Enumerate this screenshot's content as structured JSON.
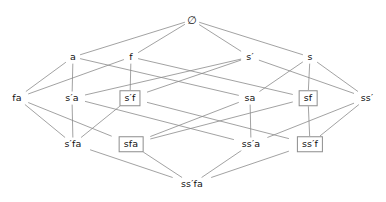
{
  "diagram": {
    "type": "hasse-lattice",
    "title": "",
    "width": 386,
    "height": 202,
    "edge_color": "#8a8a8a",
    "node_text_color": "#111111",
    "box_border_color": "#8d8d8d",
    "background": "#ffffff",
    "nodes": [
      {
        "id": "empty",
        "label": "∅",
        "x": 192,
        "y": 20,
        "boxed": false,
        "rank": 0
      },
      {
        "id": "a",
        "label": "a",
        "x": 73,
        "y": 57,
        "boxed": false,
        "rank": 1
      },
      {
        "id": "f",
        "label": "f",
        "x": 131,
        "y": 57,
        "boxed": false,
        "rank": 1
      },
      {
        "id": "s1",
        "label": "s′",
        "x": 250,
        "y": 57,
        "boxed": false,
        "rank": 1
      },
      {
        "id": "s",
        "label": "s",
        "x": 310,
        "y": 57,
        "boxed": false,
        "rank": 1
      },
      {
        "id": "fa",
        "label": "fa",
        "x": 17,
        "y": 98,
        "boxed": false,
        "rank": 2
      },
      {
        "id": "s1a",
        "label": "s′a",
        "x": 72,
        "y": 98,
        "boxed": false,
        "rank": 2
      },
      {
        "id": "s1f",
        "label": "s′f",
        "x": 130,
        "y": 98,
        "boxed": true,
        "rank": 2
      },
      {
        "id": "sa",
        "label": "sa",
        "x": 250,
        "y": 98,
        "boxed": false,
        "rank": 2
      },
      {
        "id": "sf",
        "label": "sf",
        "x": 308,
        "y": 98,
        "boxed": true,
        "rank": 2
      },
      {
        "id": "ss1",
        "label": "ss′",
        "x": 367,
        "y": 98,
        "boxed": false,
        "rank": 2
      },
      {
        "id": "s1fa",
        "label": "s′fa",
        "x": 73,
        "y": 144,
        "boxed": false,
        "rank": 3
      },
      {
        "id": "sfa",
        "label": "sfa",
        "x": 131,
        "y": 144,
        "boxed": true,
        "rank": 3
      },
      {
        "id": "ss1a",
        "label": "ss′a",
        "x": 251,
        "y": 144,
        "boxed": false,
        "rank": 3
      },
      {
        "id": "ss1f",
        "label": "ss′f",
        "x": 310,
        "y": 144,
        "boxed": true,
        "rank": 3
      },
      {
        "id": "ss1fa",
        "label": "ss′fa",
        "x": 192,
        "y": 184,
        "boxed": false,
        "rank": 4
      }
    ],
    "edges": [
      {
        "from": "empty",
        "to": "a"
      },
      {
        "from": "empty",
        "to": "f"
      },
      {
        "from": "empty",
        "to": "s1"
      },
      {
        "from": "empty",
        "to": "s"
      },
      {
        "from": "a",
        "to": "fa"
      },
      {
        "from": "a",
        "to": "s1a"
      },
      {
        "from": "a",
        "to": "sa"
      },
      {
        "from": "f",
        "to": "fa"
      },
      {
        "from": "f",
        "to": "s1f"
      },
      {
        "from": "f",
        "to": "sf"
      },
      {
        "from": "s1",
        "to": "s1a"
      },
      {
        "from": "s1",
        "to": "s1f"
      },
      {
        "from": "s1",
        "to": "ss1"
      },
      {
        "from": "s",
        "to": "sa"
      },
      {
        "from": "s",
        "to": "sf"
      },
      {
        "from": "s",
        "to": "ss1"
      },
      {
        "from": "fa",
        "to": "s1fa"
      },
      {
        "from": "fa",
        "to": "sfa"
      },
      {
        "from": "s1a",
        "to": "s1fa"
      },
      {
        "from": "s1a",
        "to": "ss1a"
      },
      {
        "from": "s1f",
        "to": "s1fa"
      },
      {
        "from": "s1f",
        "to": "ss1f"
      },
      {
        "from": "sa",
        "to": "sfa"
      },
      {
        "from": "sa",
        "to": "ss1a"
      },
      {
        "from": "sf",
        "to": "sfa"
      },
      {
        "from": "sf",
        "to": "ss1f"
      },
      {
        "from": "ss1",
        "to": "ss1a"
      },
      {
        "from": "ss1",
        "to": "ss1f"
      },
      {
        "from": "s1fa",
        "to": "ss1fa"
      },
      {
        "from": "sfa",
        "to": "ss1fa"
      },
      {
        "from": "ss1a",
        "to": "ss1fa"
      },
      {
        "from": "ss1f",
        "to": "ss1fa"
      }
    ]
  }
}
